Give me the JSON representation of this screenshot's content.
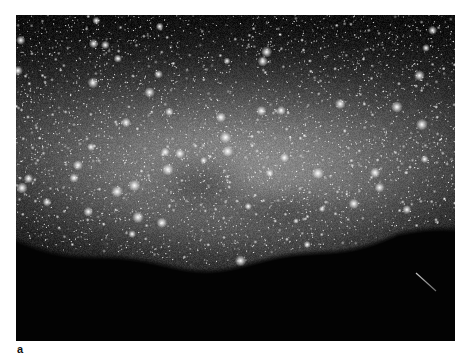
{
  "figure": {
    "panel_label": "a",
    "photo": {
      "subject": "Milky Way night sky over dark hill silhouette with a meteor streak",
      "colors": {
        "sky_dark": "#050505",
        "band_glow": "#9a9a9a",
        "ground": "#030303",
        "star": "#ffffff",
        "page_background": "#ffffff",
        "label_text": "#111111"
      }
    }
  }
}
